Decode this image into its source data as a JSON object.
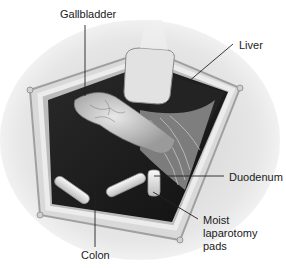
{
  "diagram": {
    "labels": [
      {
        "id": "gallbladder",
        "text": "Gallbladder"
      },
      {
        "id": "liver",
        "text": "Liver"
      },
      {
        "id": "duodenum",
        "text": "Duodenum"
      },
      {
        "id": "pads",
        "lines": [
          "Moist",
          "laparotomy",
          "pads"
        ]
      },
      {
        "id": "colon",
        "text": "Colon"
      }
    ]
  }
}
